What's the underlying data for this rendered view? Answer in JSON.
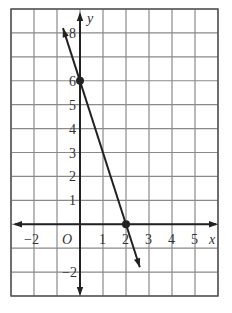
{
  "chart_data": {
    "type": "line",
    "title": "",
    "xlabel": "x",
    "ylabel": "y",
    "origin_label": "O",
    "xlim": [
      -3,
      6
    ],
    "ylim": [
      -3,
      9
    ],
    "grid": true,
    "x_tick_labels": [
      {
        "value": -2,
        "label": "−2"
      },
      {
        "value": 1,
        "label": "1"
      },
      {
        "value": 2,
        "label": "2"
      },
      {
        "value": 3,
        "label": "3"
      },
      {
        "value": 4,
        "label": "4"
      },
      {
        "value": 5,
        "label": "5"
      }
    ],
    "y_tick_labels": [
      {
        "value": -2,
        "label": "−2"
      },
      {
        "value": 1,
        "label": "1"
      },
      {
        "value": 2,
        "label": "2"
      },
      {
        "value": 3,
        "label": "3"
      },
      {
        "value": 4,
        "label": "4"
      },
      {
        "value": 5,
        "label": "5"
      },
      {
        "value": 6,
        "label": "6"
      },
      {
        "value": 8,
        "label": "8"
      }
    ],
    "series": [
      {
        "name": "line",
        "equation": "y = -3x + 6",
        "x": [
          -0.74,
          2.6
        ],
        "y": [
          8.2,
          -1.8
        ],
        "arrows_both_ends": true,
        "marked_points": [
          {
            "x": 0,
            "y": 6,
            "label": "y-intercept"
          },
          {
            "x": 2,
            "y": 0,
            "label": "x-intercept"
          }
        ]
      }
    ],
    "legend": null
  },
  "colors": {
    "grid": "#8a8a8a",
    "axis": "#222222",
    "line": "#222222",
    "border": "#555555",
    "background": "#ffffff"
  }
}
